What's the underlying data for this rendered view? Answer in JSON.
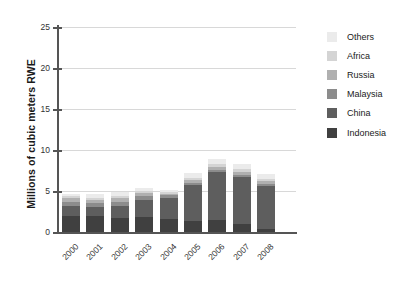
{
  "chart_data": {
    "type": "bar",
    "subtype": "stacked-column",
    "title": "",
    "xlabel": "",
    "ylabel": "Millions of cubic meters RWE",
    "categories": [
      "2000",
      "2001",
      "2002",
      "2003",
      "2004",
      "2005",
      "2006",
      "2007",
      "2008"
    ],
    "ylim": [
      0,
      25
    ],
    "yticks": [
      0,
      5,
      10,
      15,
      20,
      25
    ],
    "grid": true,
    "legend_position": "right",
    "series": [
      {
        "name": "Indonesia",
        "color": "#404040",
        "values": [
          2.0,
          1.9,
          1.7,
          1.8,
          1.6,
          1.4,
          1.5,
          1.0,
          0.4
        ]
      },
      {
        "name": "China",
        "color": "#5e5e5e",
        "values": [
          1.2,
          1.1,
          1.5,
          2.1,
          2.6,
          4.3,
          5.8,
          5.7,
          5.2
        ]
      },
      {
        "name": "Malaysia",
        "color": "#8c8c8c",
        "values": [
          0.5,
          0.5,
          0.5,
          0.5,
          0.3,
          0.3,
          0.3,
          0.3,
          0.3
        ]
      },
      {
        "name": "Russia",
        "color": "#b0b0b0",
        "values": [
          0.4,
          0.4,
          0.4,
          0.3,
          0.2,
          0.3,
          0.3,
          0.3,
          0.3
        ]
      },
      {
        "name": "Africa",
        "color": "#d4d4d4",
        "values": [
          0.3,
          0.3,
          0.3,
          0.3,
          0.2,
          0.3,
          0.4,
          0.4,
          0.3
        ]
      },
      {
        "name": "Others",
        "color": "#ebebeb",
        "values": [
          0.3,
          0.4,
          0.5,
          0.4,
          0.2,
          0.6,
          0.6,
          0.6,
          0.6
        ]
      }
    ],
    "totals": [
      4.7,
      4.6,
      4.9,
      5.4,
      5.1,
      7.2,
      8.9,
      8.3,
      7.1
    ]
  },
  "legend": {
    "items": [
      {
        "label": "Others",
        "color": "#ebebeb"
      },
      {
        "label": "Africa",
        "color": "#d4d4d4"
      },
      {
        "label": "Russia",
        "color": "#b0b0b0"
      },
      {
        "label": "Malaysia",
        "color": "#8c8c8c"
      },
      {
        "label": "China",
        "color": "#5e5e5e"
      },
      {
        "label": "Indonesia",
        "color": "#404040"
      }
    ]
  },
  "axes": {
    "y_title": "Millions of cubic meters RWE",
    "y_tick_labels": [
      "25",
      "20",
      "15",
      "10",
      "5",
      "0"
    ],
    "x_tick_labels": [
      "2000",
      "2001",
      "2002",
      "2003",
      "2004",
      "2005",
      "2006",
      "2007",
      "2008"
    ]
  }
}
